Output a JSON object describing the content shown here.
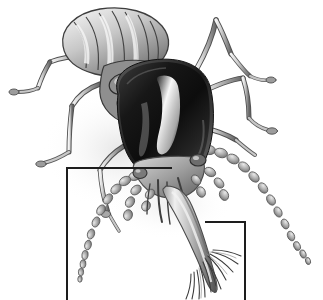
{
  "figure": {
    "title": "Nasute termite soldier",
    "view": "dorsal-anterior",
    "style": "grayscale scientific illustration",
    "background_color": "#ffffff",
    "canvas": {
      "width": 323,
      "height": 300
    }
  },
  "palette": {
    "background": "#ffffff",
    "head_dark": "#141414",
    "head_mid": "#2b2b2b",
    "head_highlight": "#fbfbfb",
    "body_light": "#d8d8d8",
    "body_mid": "#9a9a9a",
    "body_dark": "#5c5c5c",
    "outline": "#3a3a3a",
    "leader_line": "#1d1d1d",
    "shadow": "#e3e3e3"
  },
  "anatomy": {
    "abdomen": {
      "name": "abdomen",
      "description": "pale segmented abdomen with overlapping tergite rings",
      "segment_count": 8
    },
    "thorax": {
      "name": "thorax",
      "description": "pronotum partly hidden beneath the enlarged head capsule"
    },
    "head": {
      "name": "head-capsule",
      "description": "greatly enlarged glossy dark-brown head capsule with specular highlight"
    },
    "nasus": {
      "name": "nasus",
      "description": "elongated frontal projection (nasus) bearing a tuft of fine apical bristles",
      "bristle_count": 11
    },
    "antennae": {
      "name": "antennae",
      "description": "paired moniliform (beaded) antennae curving outward",
      "bead_count_per_antenna": 13,
      "count": 2
    },
    "palps": {
      "name": "maxillary-palps",
      "description": "short segmented palps flanking the mouthparts",
      "count": 4
    },
    "legs": {
      "name": "legs",
      "description": "three pairs of slender pale legs with tarsi",
      "count": 6
    }
  },
  "leaders": [
    {
      "id": "leader-left",
      "name": "leader-bracket-antenna",
      "points_to": "antenna",
      "corner_x": 67,
      "corner_y": 168,
      "horizontal_end_x": 172,
      "vertical_end_y": 300,
      "color": "#1d1d1d",
      "width": 2
    },
    {
      "id": "leader-right",
      "name": "leader-bracket-nasus",
      "points_to": "nasus",
      "corner_x": 245,
      "corner_y": 222,
      "horizontal_end_x": 205,
      "vertical_end_y": 300,
      "color": "#1d1d1d",
      "width": 2
    }
  ]
}
